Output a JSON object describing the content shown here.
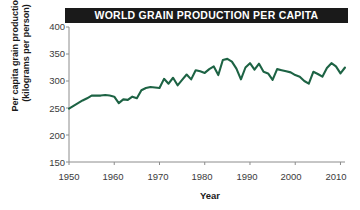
{
  "title": "WORLD GRAIN PRODUCTION PER CAPITA",
  "axis": {
    "xlabel": "Year",
    "ylabel_line1": "Per capita grain production",
    "ylabel_line2": "(kilograms per person)"
  },
  "colors": {
    "line": "#1d6344",
    "title_bar_bg": "#1a1a1a",
    "title_text": "#ffffff",
    "axis": "#8c8c8c",
    "tick_text": "#3b3b3b",
    "background": "#ffffff"
  },
  "chart_data": {
    "type": "line",
    "title": "WORLD GRAIN PRODUCTION PER CAPITA",
    "xlabel": "Year",
    "ylabel": "Per capita grain production (kilograms per person)",
    "xlim": [
      1950,
      2011
    ],
    "ylim": [
      150,
      400
    ],
    "yticks": [
      150,
      200,
      250,
      300,
      350,
      400
    ],
    "xticks": [
      1950,
      1960,
      1970,
      1980,
      1990,
      2000,
      2010
    ],
    "grid": false,
    "legend": "none",
    "series": [
      {
        "name": "World grain production per capita",
        "color": "#1d6344",
        "x": [
          1950,
          1951,
          1952,
          1953,
          1954,
          1955,
          1956,
          1957,
          1958,
          1959,
          1960,
          1961,
          1962,
          1963,
          1964,
          1965,
          1966,
          1967,
          1968,
          1969,
          1970,
          1971,
          1972,
          1973,
          1974,
          1975,
          1976,
          1977,
          1978,
          1979,
          1980,
          1981,
          1982,
          1983,
          1984,
          1985,
          1986,
          1987,
          1988,
          1989,
          1990,
          1991,
          1992,
          1993,
          1994,
          1995,
          1996,
          1997,
          1998,
          1999,
          2000,
          2001,
          2002,
          2003,
          2004,
          2005,
          2006,
          2007,
          2008,
          2009,
          2010,
          2011
        ],
        "values": [
          249,
          254,
          259,
          264,
          268,
          273,
          273,
          273,
          274,
          273,
          271,
          259,
          266,
          265,
          271,
          268,
          283,
          287,
          289,
          288,
          287,
          304,
          295,
          306,
          292,
          302,
          312,
          303,
          320,
          318,
          315,
          322,
          327,
          311,
          339,
          341,
          336,
          323,
          303,
          325,
          333,
          321,
          332,
          317,
          314,
          302,
          322,
          320,
          318,
          316,
          311,
          308,
          300,
          295,
          317,
          313,
          308,
          324,
          333,
          327,
          314,
          325
        ]
      }
    ]
  },
  "ytick_labels": [
    "400",
    "350",
    "300",
    "250",
    "200",
    "150"
  ],
  "xtick_labels": [
    "1950",
    "1960",
    "1970",
    "1980",
    "1990",
    "2000",
    "2010"
  ]
}
